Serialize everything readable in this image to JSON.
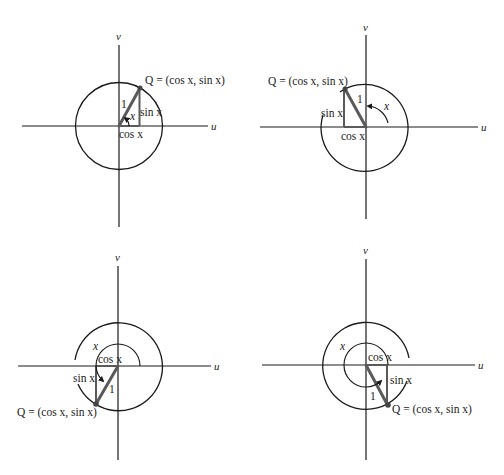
{
  "figure": {
    "colors": {
      "line": "#1a1a1a",
      "triangle": "#5a5a5a",
      "background": "#ffffff"
    },
    "axis_labels": {
      "horizontal": "u",
      "vertical": "v"
    },
    "radius_label": "1",
    "angle_label": "x",
    "cos_label": "cos x",
    "sin_label": "sin x",
    "point_label": "Q = (cos x, sin x)",
    "panels": [
      {
        "id": "quadrant-1",
        "angle_range": "0 < x < π/2",
        "position": "top-left"
      },
      {
        "id": "quadrant-2",
        "angle_range": "π/2 < x < π",
        "position": "top-right"
      },
      {
        "id": "quadrant-3",
        "angle_range": "π < x < 3π/2",
        "position": "bottom-left"
      },
      {
        "id": "quadrant-4",
        "angle_range": "3π/2 < x < 2π",
        "position": "bottom-right"
      }
    ]
  }
}
